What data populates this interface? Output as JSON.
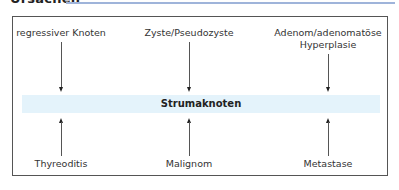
{
  "header": {
    "title": "Ursachen",
    "rule_color": "#9fb4da"
  },
  "diagram": {
    "center": {
      "label": "Strumaknoten",
      "band_color": "#e4f3fb"
    },
    "top_causes": [
      {
        "label": "regressiver Knoten"
      },
      {
        "label": "Zyste/Pseudozyste"
      },
      {
        "label_line1": "Adenom/adenomatöse",
        "label_line2": "Hyperplasie"
      }
    ],
    "bottom_causes": [
      {
        "label": "Thyreoditis"
      },
      {
        "label": "Malignom"
      },
      {
        "label": "Metastase"
      }
    ]
  }
}
